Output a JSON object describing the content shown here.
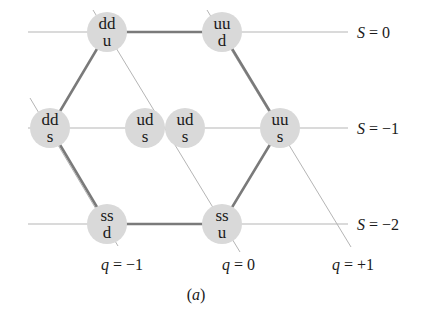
{
  "figure": {
    "caption": "(a)",
    "caption_var": "a"
  },
  "strangeness_labels": [
    {
      "var": "S",
      "text": " = 0"
    },
    {
      "var": "S",
      "text": " = −1"
    },
    {
      "var": "S",
      "text": " = −2"
    }
  ],
  "charge_labels": [
    {
      "var": "q",
      "text": " = −1"
    },
    {
      "var": "q",
      "text": " = 0"
    },
    {
      "var": "q",
      "text": " = +1"
    }
  ],
  "nodes": [
    {
      "top": "dd",
      "bottom": "u"
    },
    {
      "top": "uu",
      "bottom": "d"
    },
    {
      "top": "dd",
      "bottom": "s"
    },
    {
      "top": "ud",
      "bottom": "s"
    },
    {
      "top": "ud",
      "bottom": "s"
    },
    {
      "top": "uu",
      "bottom": "s"
    },
    {
      "top": "ss",
      "bottom": "d"
    },
    {
      "top": "ss",
      "bottom": "u"
    }
  ],
  "colors": {
    "node_fill": "#d9d9d9",
    "thin_line": "#b5b5b5",
    "hexagon_line": "#7a7a7a"
  }
}
